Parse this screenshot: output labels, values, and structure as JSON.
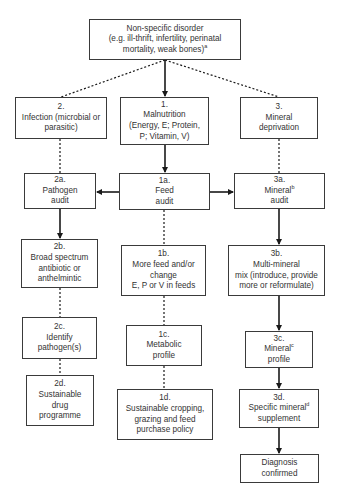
{
  "diagram": {
    "root": {
      "lines": [
        "Non-specific disorder",
        "(e.g. ill-thrift, infertility, perinatal",
        "mortality, weak  bones)"
      ],
      "footnote": "a"
    },
    "branch_2": {
      "title": "2.",
      "lines": [
        "Infection (microbial or",
        "parasitic)"
      ],
      "steps": [
        {
          "id": "2a.",
          "lines": [
            "Pathogen",
            "audit"
          ]
        },
        {
          "id": "2b.",
          "lines": [
            "Broad spectrum",
            "antibiotic or",
            "anthelmintic"
          ]
        },
        {
          "id": "2c.",
          "lines": [
            "Identify",
            "pathogen(s)"
          ]
        },
        {
          "id": "2d.",
          "lines": [
            "Sustainable",
            "drug",
            "programme"
          ]
        }
      ]
    },
    "branch_1": {
      "title": "1.",
      "lines": [
        "Malnutrition",
        "(Energy, E; Protein,",
        "P; Vitamin, V)"
      ],
      "steps": [
        {
          "id": "1a.",
          "lines": [
            "Feed",
            "audit"
          ]
        },
        {
          "id": "1b.",
          "lines": [
            "More feed and/or",
            "change",
            "E, P or V in feeds"
          ]
        },
        {
          "id": "1c.",
          "lines": [
            "Metabolic",
            "profile"
          ]
        },
        {
          "id": "1d.",
          "lines": [
            "Sustainable cropping,",
            "grazing and feed",
            "purchase policy"
          ]
        }
      ]
    },
    "branch_3": {
      "title": "3.",
      "lines": [
        "Mineral",
        "deprivation"
      ],
      "steps": [
        {
          "id": "3a.",
          "lines": [
            "Mineral",
            "audit"
          ],
          "footnote": "b"
        },
        {
          "id": "3b.",
          "lines": [
            "Multi-mineral",
            "mix (introduce, provide",
            "more or reformulate)"
          ]
        },
        {
          "id": "3c.",
          "lines": [
            "Mineral",
            "profile"
          ],
          "footnote": "c"
        },
        {
          "id": "3d.",
          "lines": [
            "Specific mineral",
            "supplement"
          ],
          "footnote": "d"
        }
      ]
    },
    "final": {
      "lines": [
        "Diagnosis",
        "confirmed"
      ]
    },
    "colors": {
      "line": "#1a1a1a",
      "border": "#3a3a3a",
      "text": "#333333"
    }
  }
}
